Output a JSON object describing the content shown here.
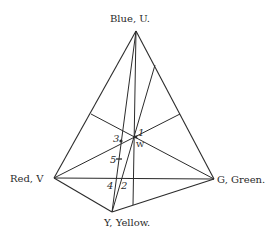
{
  "diagram": {
    "vertices": {
      "U": {
        "label": "Blue, U.",
        "x": 136,
        "y": 31
      },
      "V": {
        "label": "Red, V",
        "x": 54,
        "y": 178
      },
      "G": {
        "label": "G, Green.",
        "x": 214,
        "y": 179
      },
      "Y": {
        "label": "Y, Yellow.",
        "x": 112,
        "y": 212
      }
    },
    "points": {
      "p1": "1",
      "p2": "2",
      "p3": "3",
      "p4": "4",
      "p5": "5",
      "W": "W"
    },
    "colors": {
      "line": "#2b2b2b",
      "text": "#2a2a2a",
      "background": "#ffffff"
    }
  }
}
